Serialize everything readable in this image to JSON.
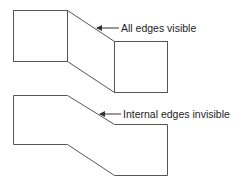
{
  "diagram": {
    "top_figure": {
      "label": "All edges visible",
      "colors": {
        "stroke": "#555555",
        "text": "#222222"
      }
    },
    "bottom_figure": {
      "label": "Internal edges invisible"
    }
  }
}
